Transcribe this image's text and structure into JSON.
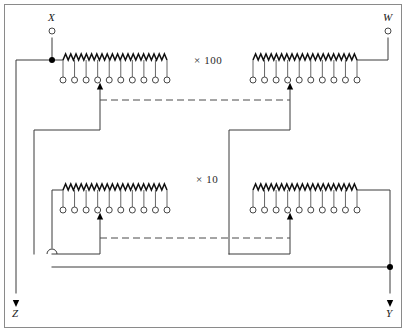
{
  "diagram": {
    "type": "circuit-schematic",
    "canvas": {
      "width": 406,
      "height": 332
    },
    "frame": {
      "x": 4,
      "y": 4,
      "width": 398,
      "height": 324,
      "stroke": "#8a8a8a"
    },
    "colors": {
      "background": "#ffffff",
      "wire": "#3a3a3a",
      "resistor": "#111111",
      "dashed_link": "#4a4a4a",
      "frame": "#8a8a8a",
      "label": "#1a1a1a"
    }
  },
  "terminals": [
    {
      "id": "X",
      "label": "X",
      "role": "input-terminal",
      "x": 52,
      "y": 31,
      "label_x": 48,
      "label_y": 21
    },
    {
      "id": "W",
      "label": "W",
      "role": "output-terminal",
      "x": 388,
      "y": 31,
      "label_x": 383,
      "label_y": 21
    },
    {
      "id": "Z",
      "label": "Z",
      "role": "output-arrow",
      "x": 16,
      "y": 300,
      "label_x": 12,
      "label_y": 317
    },
    {
      "id": "Y",
      "label": "Y",
      "role": "output-arrow",
      "x": 390,
      "y": 300,
      "label_x": 386,
      "label_y": 317
    }
  ],
  "annotations": [
    {
      "id": "mult-100",
      "text": "× 100",
      "x": 194,
      "y": 64
    },
    {
      "id": "mult-10",
      "text": "× 10",
      "x": 196,
      "y": 183
    }
  ],
  "ladders": [
    {
      "id": "ladder-top-left",
      "name": "top-left-resistor-ladder",
      "decade": "× 100",
      "position": "top-left",
      "x": 63,
      "y": 60,
      "width": 104,
      "tap_count": 10,
      "zig_peaks": 20,
      "wiper_tap_index": 3,
      "tap_circle_y": 80,
      "wiper_arrow_x": 100
    },
    {
      "id": "ladder-top-right",
      "name": "top-right-resistor-ladder",
      "decade": "× 100",
      "position": "top-right",
      "x": 253,
      "y": 60,
      "width": 104,
      "tap_count": 10,
      "zig_peaks": 20,
      "wiper_tap_index": 3,
      "tap_circle_y": 80,
      "wiper_arrow_x": 290
    },
    {
      "id": "ladder-bottom-left",
      "name": "bottom-left-resistor-ladder",
      "decade": "× 10",
      "position": "bottom-left",
      "x": 63,
      "y": 190,
      "width": 104,
      "tap_count": 10,
      "zig_peaks": 20,
      "wiper_tap_index": 3,
      "tap_circle_y": 210,
      "wiper_arrow_x": 100
    },
    {
      "id": "ladder-bottom-right",
      "name": "bottom-right-resistor-ladder",
      "decade": "× 10",
      "position": "bottom-right",
      "x": 253,
      "y": 190,
      "width": 104,
      "tap_count": 10,
      "zig_peaks": 20,
      "wiper_tap_index": 3,
      "tap_circle_y": 210,
      "wiper_arrow_x": 290
    }
  ],
  "dashed_links": [
    {
      "id": "gang-link-top",
      "from_x": 100,
      "to_x": 290,
      "y": 100
    },
    {
      "id": "gang-link-bottom",
      "from_x": 100,
      "to_x": 290,
      "y": 238
    }
  ],
  "junctions": [
    {
      "id": "junction-x-bus",
      "x": 52,
      "y": 60
    },
    {
      "id": "junction-y-bus",
      "x": 390,
      "y": 267
    }
  ],
  "wire_hop": {
    "id": "wire-hop-left-bus",
    "x": 52,
    "y": 254,
    "radius": 5
  },
  "wires": {
    "x_drop": "M52,38 L52,60",
    "x_to_ladder": "M52,60 L63,60",
    "x_bus_left": "M52,60 L16,60 L16,293",
    "w_drop": "M388,38 L388,60 L357,60",
    "top_left_wiper": "M100,84 L100,130 L34,130 L34,254",
    "top_right_wiper": "M290,84 L290,130 L229,130 L229,254",
    "bottom_left_wiper": "M100,214 L100,254 L52,254",
    "bottom_left_in": "M63,190 L52,190 L52,248",
    "bottom_right_wiper": "M290,214 L290,254 L229,254",
    "bottom_right_out": "M357,190 L390,190 L390,293",
    "bottom_return_bus": "M52,267 L390,267"
  },
  "meta": {
    "tap_circle_radius": 3,
    "terminal_circle_radius": 3,
    "junction_dot_radius": 3
  }
}
